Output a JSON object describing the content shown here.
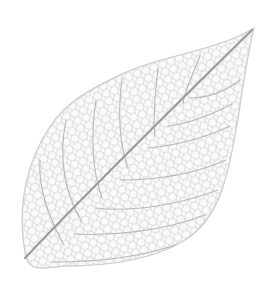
{
  "image": {
    "subject": "skeleton leaf",
    "background_color": "#ffffff",
    "vein_color": "#b4b4b4",
    "midrib_color": "#9a9a9a",
    "mesh_color": "#d2d2d2"
  }
}
